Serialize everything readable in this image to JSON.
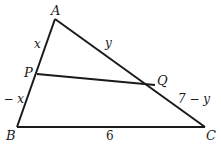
{
  "diagram": {
    "type": "triangle",
    "vertices": {
      "A": {
        "label": "A",
        "x": 55,
        "y": 19
      },
      "B": {
        "label": "B",
        "x": 17,
        "y": 127
      },
      "C": {
        "label": "C",
        "x": 205,
        "y": 127
      },
      "P": {
        "label": "P",
        "x": 37,
        "y": 74
      },
      "Q": {
        "label": "Q",
        "x": 155,
        "y": 85
      }
    },
    "segment_labels": {
      "AP": "x",
      "AQ": "y",
      "PB": "6 − x",
      "QC": "7 − y",
      "BC": "6"
    },
    "stroke_color": "#1a1a1a"
  }
}
